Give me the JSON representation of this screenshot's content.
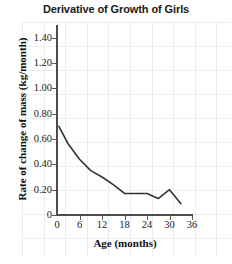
{
  "chart_data": {
    "type": "line",
    "title": "Derivative of Growth of Girls",
    "xlabel": "Age (months)",
    "ylabel": "Rate of change of mass (kg/month)",
    "xlim": [
      0,
      36
    ],
    "ylim": [
      0,
      1.5
    ],
    "xticks": [
      "0",
      "6",
      "12",
      "18",
      "24",
      "30",
      "36"
    ],
    "xtick_values": [
      0,
      6,
      12,
      18,
      24,
      30,
      36
    ],
    "yticks": [
      "0",
      "0.20",
      "0.40",
      "0.60",
      "0.80",
      "1.00",
      "1.20",
      "1.40"
    ],
    "ytick_values": [
      0,
      0.2,
      0.4,
      0.6,
      0.8,
      1.0,
      1.2,
      1.4
    ],
    "grid": true,
    "legend": "none",
    "series": [
      {
        "name": "Rate of change of mass",
        "color": "#333333",
        "x": [
          0.5,
          3,
          6,
          9,
          12,
          15,
          18,
          21,
          24,
          27,
          30,
          33
        ],
        "y": [
          0.7,
          0.56,
          0.44,
          0.35,
          0.3,
          0.24,
          0.17,
          0.17,
          0.17,
          0.13,
          0.2,
          0.09
        ]
      }
    ]
  },
  "axis": {
    "y_title": "Rate of change of mass (kg/month)",
    "x_title": "Age (months)"
  }
}
